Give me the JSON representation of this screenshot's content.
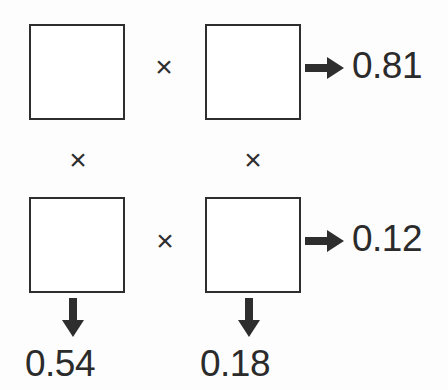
{
  "diagram": {
    "type": "outer-product-grid",
    "background_color": "#fdfdfd",
    "stroke_color": "#2e2e2e",
    "text_color": "#2b2b2b",
    "grid": {
      "rows": 2,
      "columns": 2,
      "cells": [
        {
          "row": 0,
          "col": 0,
          "label": ""
        },
        {
          "row": 0,
          "col": 1,
          "label": ""
        },
        {
          "row": 1,
          "col": 0,
          "label": ""
        },
        {
          "row": 1,
          "col": 1,
          "label": ""
        }
      ]
    },
    "operators": {
      "row0_between_cells": "×",
      "row1_between_cells": "×",
      "col0_between_rows": "×",
      "col1_between_rows": "×"
    },
    "arrows": {
      "row0_right": "arrow-right",
      "row1_right": "arrow-right",
      "col0_down": "arrow-down",
      "col1_down": "arrow-down"
    },
    "row_products": [
      {
        "row": 0,
        "value": "0.81"
      },
      {
        "row": 1,
        "value": "0.12"
      }
    ],
    "column_products": [
      {
        "col": 0,
        "value": "0.54"
      },
      {
        "col": 1,
        "value": "0.18"
      }
    ]
  }
}
